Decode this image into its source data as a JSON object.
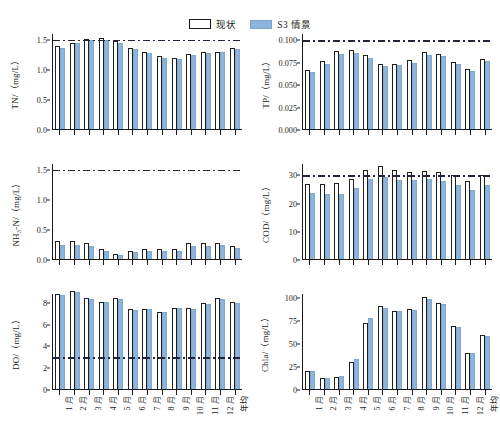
{
  "legend": {
    "entries": [
      {
        "label": "现状",
        "style": "outline",
        "color": "#ffffff"
      },
      {
        "label": "S3 情景",
        "style": "filled",
        "color": "#8cb4dc"
      }
    ]
  },
  "colors": {
    "s3_bar": "#8cb4dc",
    "current_bar_outline": "#1f1f1f",
    "reference_line": "#23233a",
    "axis": "#1a1a1a"
  },
  "categories": [
    "1 月",
    "2 月",
    "3 月",
    "4 月",
    "5 月",
    "6 月",
    "7 月",
    "8 月",
    "9 月",
    "10 月",
    "11 月",
    "12 月",
    "年均"
  ],
  "chart_data": [
    {
      "type": "bar",
      "panel": "TN",
      "title": "",
      "ylabel": "TN/（mg/L）",
      "xlabel": "",
      "ylim": [
        0,
        1.6
      ],
      "yticks": [
        0.0,
        0.5,
        1.0,
        1.5
      ],
      "yticklabels": [
        "0.0",
        "0.5",
        "1.0",
        "1.5"
      ],
      "categories": [
        "1 月",
        "2 月",
        "3 月",
        "4 月",
        "5 月",
        "6 月",
        "7 月",
        "8 月",
        "9 月",
        "10 月",
        "11 月",
        "12 月",
        "年均"
      ],
      "series": [
        {
          "name": "现状",
          "values": [
            1.38,
            1.44,
            1.5,
            1.51,
            1.46,
            1.35,
            1.28,
            1.21,
            1.18,
            1.25,
            1.28,
            1.29,
            1.35
          ]
        },
        {
          "name": "S3 情景",
          "values": [
            1.35,
            1.43,
            1.49,
            1.49,
            1.44,
            1.33,
            1.26,
            1.19,
            1.16,
            1.23,
            1.26,
            1.28,
            1.33
          ]
        }
      ],
      "reference_line": {
        "value": 1.5,
        "style": "dash-dot"
      },
      "grid": false,
      "legend_position": "top-center"
    },
    {
      "type": "bar",
      "panel": "TP",
      "title": "",
      "ylabel": "TP/（mg/L）",
      "xlabel": "",
      "ylim": [
        0,
        0.107
      ],
      "yticks": [
        0.0,
        0.025,
        0.05,
        0.075,
        0.1
      ],
      "yticklabels": [
        "0.000",
        "0.025",
        "0.050",
        "0.075",
        "0.100"
      ],
      "categories": [
        "1 月",
        "2 月",
        "3 月",
        "4 月",
        "5 月",
        "6 月",
        "7 月",
        "8 月",
        "9 月",
        "10 月",
        "11 月",
        "12 月",
        "年均"
      ],
      "series": [
        {
          "name": "现状",
          "values": [
            0.066,
            0.076,
            0.087,
            0.088,
            0.082,
            0.072,
            0.073,
            0.077,
            0.086,
            0.084,
            0.075,
            0.067,
            0.078
          ]
        },
        {
          "name": "S3 情景",
          "values": [
            0.063,
            0.073,
            0.084,
            0.085,
            0.079,
            0.07,
            0.071,
            0.074,
            0.083,
            0.081,
            0.073,
            0.065,
            0.076
          ]
        }
      ],
      "reference_line": {
        "value": 0.1,
        "style": "dash-dot"
      },
      "grid": false
    },
    {
      "type": "bar",
      "panel": "NH3-N",
      "title": "",
      "ylabel": "NH₃-N/（mg/L）",
      "xlabel": "",
      "ylim": [
        0,
        1.6
      ],
      "yticks": [
        0.0,
        0.5,
        1.0,
        1.5
      ],
      "yticklabels": [
        "0.0",
        "0.5",
        "1.0",
        "1.5"
      ],
      "categories": [
        "1 月",
        "2 月",
        "3 月",
        "4 月",
        "5 月",
        "6 月",
        "7 月",
        "8 月",
        "9 月",
        "10 月",
        "11 月",
        "12 月",
        "年均"
      ],
      "series": [
        {
          "name": "现状",
          "values": [
            0.3,
            0.3,
            0.26,
            0.17,
            0.09,
            0.14,
            0.16,
            0.16,
            0.16,
            0.27,
            0.26,
            0.27,
            0.21
          ]
        },
        {
          "name": "S3 情景",
          "values": [
            0.24,
            0.24,
            0.22,
            0.14,
            0.07,
            0.12,
            0.14,
            0.14,
            0.14,
            0.21,
            0.22,
            0.24,
            0.18
          ]
        }
      ],
      "reference_line": {
        "value": 1.5,
        "style": "dash-dot"
      },
      "grid": false
    },
    {
      "type": "bar",
      "panel": "COD",
      "title": "",
      "ylabel": "COD/（mg/L）",
      "xlabel": "",
      "ylim": [
        0,
        34
      ],
      "yticks": [
        0,
        10,
        20,
        30
      ],
      "yticklabels": [
        "0",
        "10",
        "20",
        "30"
      ],
      "categories": [
        "1 月",
        "2 月",
        "3 月",
        "4 月",
        "5 月",
        "6 月",
        "7 月",
        "8 月",
        "9 月",
        "10 月",
        "11 月",
        "12 月",
        "年均"
      ],
      "series": [
        {
          "name": "现状",
          "values": [
            26.5,
            26.4,
            26.9,
            28.4,
            31.5,
            32.8,
            31.4,
            30.8,
            31.0,
            30.9,
            29.8,
            27.8,
            29.6
          ]
        },
        {
          "name": "S3 情景",
          "values": [
            23.4,
            23.1,
            23.2,
            25.3,
            28.2,
            29.1,
            28.0,
            27.9,
            28.2,
            27.7,
            26.2,
            24.3,
            26.1
          ]
        }
      ],
      "reference_line": {
        "value": 30,
        "style": "dash-dot"
      },
      "grid": false
    },
    {
      "type": "bar",
      "panel": "DO",
      "title": "",
      "ylabel": "DO/（mg/L）",
      "xlabel": "",
      "ylim": [
        0,
        8.8
      ],
      "yticks": [
        0,
        2,
        4,
        6,
        8
      ],
      "yticklabels": [
        "0",
        "2",
        "4",
        "6",
        "8"
      ],
      "categories": [
        "1 月",
        "2 月",
        "3 月",
        "4 月",
        "5 月",
        "6 月",
        "7 月",
        "8 月",
        "9 月",
        "10 月",
        "11 月",
        "12 月",
        "年均"
      ],
      "series": [
        {
          "name": "现状",
          "values": [
            8.7,
            9.0,
            8.3,
            8.0,
            8.3,
            7.3,
            7.35,
            7.1,
            7.45,
            7.4,
            7.85,
            8.3,
            7.95
          ]
        },
        {
          "name": "S3 情景",
          "values": [
            8.6,
            8.9,
            8.25,
            7.95,
            8.25,
            7.25,
            7.3,
            7.05,
            7.4,
            7.3,
            7.8,
            8.25,
            7.9
          ]
        }
      ],
      "reference_line": {
        "value": 3,
        "style": "dash-dot"
      },
      "grid": false
    },
    {
      "type": "bar",
      "panel": "Chla",
      "title": "",
      "ylabel": "Chla/（mg/L）",
      "xlabel": "",
      "ylim": [
        0,
        104
      ],
      "yticks": [
        0,
        25,
        50,
        75,
        100
      ],
      "yticklabels": [
        "0",
        "25",
        "50",
        "75",
        "100"
      ],
      "categories": [
        "1 月",
        "2 月",
        "3 月",
        "4 月",
        "5 月",
        "6 月",
        "7 月",
        "8 月",
        "9 月",
        "10 月",
        "11 月",
        "12 月",
        "年均"
      ],
      "series": [
        {
          "name": "现状",
          "values": [
            20,
            11.5,
            13,
            29,
            71,
            90,
            84,
            86.5,
            100,
            93,
            68,
            39.5,
            58
          ]
        },
        {
          "name": "S3 情景",
          "values": [
            19,
            11.5,
            14.5,
            33,
            77,
            87.5,
            84,
            85.5,
            98,
            92,
            67,
            38.5,
            57.5
          ]
        }
      ],
      "reference_line": null,
      "grid": false
    }
  ]
}
